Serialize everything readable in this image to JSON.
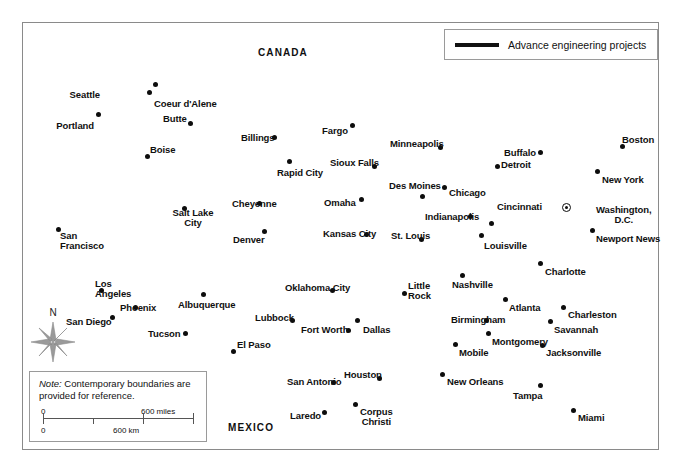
{
  "legend": {
    "swatch_name": "thick-black-line",
    "label": "Advance engineering projects"
  },
  "note": {
    "prefix": "Note:",
    "body": " Contemporary boundaries are provided for reference."
  },
  "scale": {
    "miles_start": "0",
    "miles_end": "600 miles",
    "km_start": "0",
    "km_mid": "600 km"
  },
  "compass": {
    "north_label": "N"
  },
  "countries": [
    {
      "name": "CANADA",
      "x": 258,
      "y": 47
    },
    {
      "name": "MEXICO",
      "x": 228,
      "y": 422
    }
  ],
  "cities": [
    {
      "name": "Seattle",
      "lx": 100,
      "ly": 90,
      "align": "r",
      "dx": 155,
      "dy": 84,
      "type": "city"
    },
    {
      "name": "Coeur d'Alene",
      "lx": 154,
      "ly": 99,
      "align": "l",
      "dx": 149,
      "dy": 92,
      "type": "city"
    },
    {
      "name": "Portland",
      "lx": 94,
      "ly": 121,
      "align": "r",
      "dx": 98,
      "dy": 114,
      "type": "city"
    },
    {
      "name": "Butte",
      "lx": 163,
      "ly": 114,
      "align": "l",
      "dx": 190,
      "dy": 123,
      "type": "city"
    },
    {
      "name": "Boise",
      "lx": 150,
      "ly": 145,
      "align": "l",
      "dx": 147,
      "dy": 156,
      "type": "city"
    },
    {
      "name": "Billings",
      "lx": 241,
      "ly": 133,
      "align": "l",
      "dx": 274,
      "dy": 137,
      "type": "city"
    },
    {
      "name": "Fargo",
      "lx": 322,
      "ly": 126,
      "align": "l",
      "dx": 352,
      "dy": 125,
      "type": "city"
    },
    {
      "name": "Minneapolis",
      "lx": 390,
      "ly": 139,
      "align": "l",
      "dx": 440,
      "dy": 147,
      "type": "city"
    },
    {
      "name": "Buffalo",
      "lx": 504,
      "ly": 148,
      "align": "l",
      "dx": 540,
      "dy": 152,
      "type": "city"
    },
    {
      "name": "Boston",
      "lx": 622,
      "ly": 135,
      "align": "l",
      "dx": 622,
      "dy": 146,
      "type": "city"
    },
    {
      "name": "Detroit",
      "lx": 501,
      "ly": 160,
      "align": "l",
      "dx": 497,
      "dy": 166,
      "type": "city"
    },
    {
      "name": "Rapid City",
      "lx": 277,
      "ly": 168,
      "align": "l",
      "dx": 289,
      "dy": 161,
      "type": "city"
    },
    {
      "name": "Sioux Falls",
      "lx": 330,
      "ly": 158,
      "align": "l",
      "dx": 374,
      "dy": 166,
      "type": "city"
    },
    {
      "name": "New York",
      "lx": 602,
      "ly": 175,
      "align": "l",
      "dx": 597,
      "dy": 171,
      "type": "city"
    },
    {
      "name": "Des Moines",
      "lx": 389,
      "ly": 181,
      "align": "l",
      "dx": 422,
      "dy": 196,
      "type": "city"
    },
    {
      "name": "Chicago",
      "lx": 449,
      "ly": 188,
      "align": "l",
      "dx": 444,
      "dy": 187,
      "type": "city"
    },
    {
      "name": "Omaha",
      "lx": 324,
      "ly": 198,
      "align": "l",
      "dx": 361,
      "dy": 199,
      "type": "city"
    },
    {
      "name": "Cheyenne",
      "lx": 232,
      "ly": 199,
      "align": "l",
      "dx": 259,
      "dy": 203,
      "type": "city"
    },
    {
      "name": "Salt Lake City",
      "lx": 193,
      "ly": 208,
      "align": "c",
      "dx": 184,
      "dy": 208,
      "type": "city",
      "two_line": true
    },
    {
      "name": "Indianapolis",
      "lx": 425,
      "ly": 212,
      "align": "l",
      "dx": 470,
      "dy": 216,
      "type": "city"
    },
    {
      "name": "Cincinnati",
      "lx": 497,
      "ly": 202,
      "align": "l",
      "dx": 491,
      "dy": 223,
      "type": "city"
    },
    {
      "name": "Washington, D.C.",
      "lx": 596,
      "ly": 205,
      "align": "l",
      "dx": 566,
      "dy": 207,
      "type": "capital",
      "two_line": true
    },
    {
      "name": "Denver",
      "lx": 233,
      "ly": 235,
      "align": "l",
      "dx": 264,
      "dy": 231,
      "type": "city"
    },
    {
      "name": "Kansas City",
      "lx": 323,
      "ly": 229,
      "align": "l",
      "dx": 366,
      "dy": 234,
      "type": "city"
    },
    {
      "name": "St. Louis",
      "lx": 391,
      "ly": 231,
      "align": "l",
      "dx": 421,
      "dy": 239,
      "type": "city"
    },
    {
      "name": "Louisville",
      "lx": 484,
      "ly": 241,
      "align": "l",
      "dx": 481,
      "dy": 235,
      "type": "city"
    },
    {
      "name": "Newport News",
      "lx": 596,
      "ly": 234,
      "align": "l",
      "dx": 592,
      "dy": 230,
      "type": "city"
    },
    {
      "name": "San Francisco",
      "lx": 60,
      "ly": 231,
      "align": "l",
      "dx": 58,
      "dy": 229,
      "type": "city",
      "two_line": true
    },
    {
      "name": "Charlotte",
      "lx": 545,
      "ly": 267,
      "align": "l",
      "dx": 540,
      "dy": 263,
      "type": "city"
    },
    {
      "name": "Los Angeles",
      "lx": 95,
      "ly": 279,
      "align": "l",
      "dx": 101,
      "dy": 290,
      "type": "city",
      "two_line": true
    },
    {
      "name": "Oklahoma City",
      "lx": 285,
      "ly": 283,
      "align": "l",
      "dx": 332,
      "dy": 290,
      "type": "city"
    },
    {
      "name": "Little Rock",
      "lx": 408,
      "ly": 281,
      "align": "l",
      "dx": 404,
      "dy": 293,
      "type": "city",
      "two_line": true
    },
    {
      "name": "Nashville",
      "lx": 452,
      "ly": 280,
      "align": "l",
      "dx": 462,
      "dy": 275,
      "type": "city"
    },
    {
      "name": "Atlanta",
      "lx": 509,
      "ly": 303,
      "align": "l",
      "dx": 505,
      "dy": 299,
      "type": "city"
    },
    {
      "name": "Phoenix",
      "lx": 120,
      "ly": 303,
      "align": "l",
      "dx": 135,
      "dy": 307,
      "type": "city"
    },
    {
      "name": "Albuquerque",
      "lx": 178,
      "ly": 300,
      "align": "l",
      "dx": 203,
      "dy": 294,
      "type": "city"
    },
    {
      "name": "Charleston",
      "lx": 568,
      "ly": 310,
      "align": "l",
      "dx": 563,
      "dy": 307,
      "type": "city"
    },
    {
      "name": "San Diego",
      "lx": 66,
      "ly": 317,
      "align": "l",
      "dx": 112,
      "dy": 317,
      "type": "city"
    },
    {
      "name": "Lubbock",
      "lx": 255,
      "ly": 313,
      "align": "l",
      "dx": 292,
      "dy": 320,
      "type": "city"
    },
    {
      "name": "Dallas",
      "lx": 363,
      "ly": 325,
      "align": "l",
      "dx": 357,
      "dy": 320,
      "type": "city"
    },
    {
      "name": "Birmingham",
      "lx": 451,
      "ly": 315,
      "align": "l",
      "dx": 486,
      "dy": 320,
      "type": "city"
    },
    {
      "name": "Savannah",
      "lx": 554,
      "ly": 325,
      "align": "l",
      "dx": 550,
      "dy": 321,
      "type": "city"
    },
    {
      "name": "Tucson",
      "lx": 148,
      "ly": 329,
      "align": "l",
      "dx": 185,
      "dy": 333,
      "type": "city"
    },
    {
      "name": "Fort Worth",
      "lx": 301,
      "ly": 325,
      "align": "l",
      "dx": 348,
      "dy": 330,
      "type": "city"
    },
    {
      "name": "Montgomery",
      "lx": 492,
      "ly": 337,
      "align": "l",
      "dx": 488,
      "dy": 333,
      "type": "city"
    },
    {
      "name": "El Paso",
      "lx": 237,
      "ly": 340,
      "align": "l",
      "dx": 233,
      "dy": 351,
      "type": "city"
    },
    {
      "name": "Mobile",
      "lx": 459,
      "ly": 348,
      "align": "l",
      "dx": 455,
      "dy": 344,
      "type": "city"
    },
    {
      "name": "Jacksonville",
      "lx": 546,
      "ly": 348,
      "align": "l",
      "dx": 542,
      "dy": 345,
      "type": "city"
    },
    {
      "name": "San Antonio",
      "lx": 287,
      "ly": 377,
      "align": "l",
      "dx": 333,
      "dy": 382,
      "type": "city"
    },
    {
      "name": "Houston",
      "lx": 344,
      "ly": 370,
      "align": "l",
      "dx": 379,
      "dy": 378,
      "type": "city"
    },
    {
      "name": "New Orleans",
      "lx": 447,
      "ly": 377,
      "align": "l",
      "dx": 442,
      "dy": 374,
      "type": "city"
    },
    {
      "name": "Tampa",
      "lx": 513,
      "ly": 391,
      "align": "l",
      "dx": 540,
      "dy": 385,
      "type": "city"
    },
    {
      "name": "Laredo",
      "lx": 290,
      "ly": 411,
      "align": "l",
      "dx": 324,
      "dy": 412,
      "type": "city"
    },
    {
      "name": "Corpus Christi",
      "lx": 360,
      "ly": 407,
      "align": "l",
      "dx": 355,
      "dy": 404,
      "type": "city",
      "two_line": true
    },
    {
      "name": "Miami",
      "lx": 578,
      "ly": 413,
      "align": "l",
      "dx": 573,
      "dy": 410,
      "type": "city"
    }
  ]
}
